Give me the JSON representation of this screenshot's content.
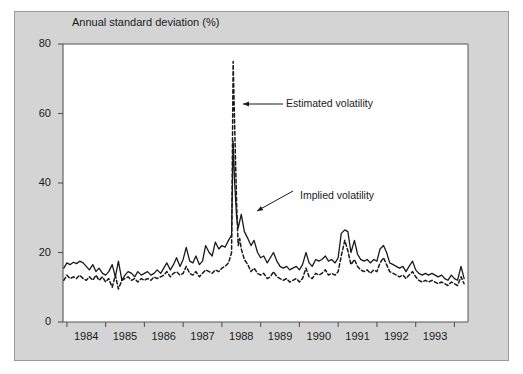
{
  "figure": {
    "background_color": "#d4d4d4",
    "plot_background_color": "#ffffff",
    "border_color": "#9a9a9a"
  },
  "chart_data": {
    "type": "line",
    "title": "Annual standard deviation (%)",
    "xlabel": "",
    "ylabel": "Annual standard deviation (%)",
    "xlim": [
      1983.4,
      1993.85
    ],
    "ylim": [
      0,
      80
    ],
    "yticks": [
      0,
      20,
      40,
      60,
      80
    ],
    "ytick_labels": [
      "0",
      "20",
      "40",
      "60",
      "80"
    ],
    "xticks": [
      1984,
      1985,
      1986,
      1987,
      1988,
      1989,
      1990,
      1991,
      1992,
      1993
    ],
    "xtick_labels": [
      "1984",
      "1985",
      "1986",
      "1987",
      "1988",
      "1989",
      "1990",
      "1991",
      "1992",
      "1993"
    ],
    "grid": false,
    "legend_position": "inline-annotations",
    "annotations": [
      {
        "text": "Estimated volatility",
        "series": "Estimated volatility",
        "arrow": "left",
        "text_x": 286,
        "text_y": 104,
        "arrow_from_x": 283,
        "arrow_from_y": 104,
        "arrow_to_x": 243,
        "arrow_to_y": 104
      },
      {
        "text": "Implied volatility",
        "series": "Implied volatility",
        "arrow": "down-left",
        "text_x": 300,
        "text_y": 196,
        "arrow_from_x": 293,
        "arrow_from_y": 191,
        "arrow_to_x": 257,
        "arrow_to_y": 211
      }
    ],
    "series": [
      {
        "name": "Implied volatility",
        "style": "solid",
        "color": "#1a1a1a",
        "x": [
          1983.42,
          1983.5,
          1983.58,
          1983.67,
          1983.75,
          1983.83,
          1983.92,
          1984.0,
          1984.08,
          1984.17,
          1984.25,
          1984.33,
          1984.42,
          1984.5,
          1984.58,
          1984.67,
          1984.75,
          1984.83,
          1984.92,
          1985.0,
          1985.08,
          1985.17,
          1985.25,
          1985.33,
          1985.42,
          1985.5,
          1985.58,
          1985.67,
          1985.75,
          1985.83,
          1985.92,
          1986.0,
          1986.08,
          1986.17,
          1986.25,
          1986.33,
          1986.42,
          1986.5,
          1986.58,
          1986.67,
          1986.75,
          1986.83,
          1986.92,
          1987.0,
          1987.08,
          1987.17,
          1987.25,
          1987.33,
          1987.42,
          1987.5,
          1987.58,
          1987.67,
          1987.75,
          1987.79,
          1987.83,
          1987.88,
          1987.92,
          1987.96,
          1988.0,
          1988.08,
          1988.17,
          1988.25,
          1988.33,
          1988.42,
          1988.5,
          1988.58,
          1988.67,
          1988.75,
          1988.83,
          1988.92,
          1989.0,
          1989.08,
          1989.17,
          1989.25,
          1989.33,
          1989.42,
          1989.5,
          1989.58,
          1989.67,
          1989.75,
          1989.83,
          1989.92,
          1990.0,
          1990.08,
          1990.17,
          1990.25,
          1990.33,
          1990.42,
          1990.5,
          1990.58,
          1990.67,
          1990.75,
          1990.83,
          1990.92,
          1991.0,
          1991.08,
          1991.17,
          1991.25,
          1991.33,
          1991.42,
          1991.5,
          1991.58,
          1991.67,
          1991.75,
          1991.83,
          1991.92,
          1992.0,
          1992.08,
          1992.17,
          1992.25,
          1992.33,
          1992.42,
          1992.5,
          1992.58,
          1992.67,
          1992.75,
          1992.83,
          1992.92,
          1993.0,
          1993.08,
          1993.17,
          1993.25,
          1993.33,
          1993.42,
          1993.5,
          1993.58,
          1993.67,
          1993.75
        ],
        "y": [
          15.5,
          17.0,
          16.5,
          17.2,
          16.8,
          17.5,
          17.0,
          16.0,
          15.0,
          16.5,
          14.5,
          15.5,
          14.0,
          13.5,
          14.5,
          16.5,
          13.0,
          17.5,
          12.0,
          13.5,
          14.5,
          14.0,
          13.0,
          14.5,
          13.5,
          14.0,
          14.5,
          13.5,
          14.0,
          15.0,
          14.0,
          15.5,
          17.0,
          15.0,
          16.5,
          18.5,
          16.0,
          18.0,
          21.5,
          17.5,
          17.0,
          19.0,
          16.5,
          17.5,
          22.0,
          20.0,
          19.0,
          23.0,
          21.0,
          22.0,
          21.5,
          23.5,
          25.0,
          52.0,
          40.0,
          30.0,
          27.0,
          29.0,
          31.0,
          26.0,
          24.0,
          22.0,
          23.5,
          20.0,
          18.5,
          19.0,
          17.0,
          18.5,
          20.0,
          17.5,
          16.0,
          15.5,
          16.0,
          15.0,
          15.5,
          16.0,
          15.0,
          16.5,
          20.0,
          17.0,
          16.0,
          18.0,
          17.5,
          18.0,
          19.0,
          17.5,
          18.0,
          17.0,
          18.5,
          25.5,
          26.5,
          26.0,
          20.0,
          23.5,
          19.5,
          18.0,
          17.5,
          18.0,
          17.0,
          18.0,
          17.5,
          21.0,
          22.0,
          20.0,
          17.0,
          16.5,
          16.0,
          15.5,
          16.0,
          14.5,
          16.0,
          17.5,
          15.0,
          14.0,
          13.5,
          14.0,
          13.5,
          14.0,
          13.5,
          13.0,
          13.5,
          12.5,
          12.0,
          13.5,
          12.5,
          12.0,
          16.0,
          12.5
        ]
      },
      {
        "name": "Estimated volatility",
        "style": "dashed",
        "color": "#1a1a1a",
        "x": [
          1983.42,
          1983.5,
          1983.58,
          1983.67,
          1983.75,
          1983.83,
          1983.92,
          1984.0,
          1984.08,
          1984.17,
          1984.25,
          1984.33,
          1984.42,
          1984.5,
          1984.58,
          1984.67,
          1984.75,
          1984.83,
          1984.92,
          1985.0,
          1985.08,
          1985.17,
          1985.25,
          1985.33,
          1985.42,
          1985.5,
          1985.58,
          1985.67,
          1985.75,
          1985.83,
          1985.92,
          1986.0,
          1986.08,
          1986.17,
          1986.25,
          1986.33,
          1986.42,
          1986.5,
          1986.58,
          1986.67,
          1986.75,
          1986.83,
          1986.92,
          1987.0,
          1987.08,
          1987.17,
          1987.25,
          1987.33,
          1987.42,
          1987.5,
          1987.58,
          1987.67,
          1987.75,
          1987.79,
          1987.83,
          1987.88,
          1987.92,
          1987.96,
          1988.0,
          1988.08,
          1988.17,
          1988.25,
          1988.33,
          1988.42,
          1988.5,
          1988.58,
          1988.67,
          1988.75,
          1988.83,
          1988.92,
          1989.0,
          1989.08,
          1989.17,
          1989.25,
          1989.33,
          1989.42,
          1989.5,
          1989.58,
          1989.67,
          1989.75,
          1989.83,
          1989.92,
          1990.0,
          1990.08,
          1990.17,
          1990.25,
          1990.33,
          1990.42,
          1990.5,
          1990.58,
          1990.67,
          1990.75,
          1990.83,
          1990.92,
          1991.0,
          1991.08,
          1991.17,
          1991.25,
          1991.33,
          1991.42,
          1991.5,
          1991.58,
          1991.67,
          1991.75,
          1991.83,
          1991.92,
          1992.0,
          1992.08,
          1992.17,
          1992.25,
          1992.33,
          1992.42,
          1992.5,
          1992.58,
          1992.67,
          1992.75,
          1992.83,
          1992.92,
          1993.0,
          1993.08,
          1993.17,
          1993.25,
          1993.33,
          1993.42,
          1993.5,
          1993.58,
          1993.67,
          1993.75
        ],
        "y": [
          12.0,
          13.5,
          12.5,
          13.0,
          12.5,
          13.5,
          12.5,
          12.0,
          13.0,
          12.0,
          13.5,
          12.0,
          13.0,
          11.5,
          12.5,
          10.0,
          13.5,
          9.5,
          12.0,
          12.5,
          13.0,
          12.0,
          12.5,
          11.5,
          12.5,
          12.0,
          12.5,
          12.0,
          13.0,
          12.5,
          13.0,
          13.5,
          14.5,
          13.0,
          14.0,
          14.5,
          13.5,
          14.0,
          16.0,
          14.0,
          13.5,
          14.5,
          13.0,
          14.0,
          15.0,
          14.5,
          14.0,
          15.0,
          14.5,
          15.5,
          16.0,
          17.0,
          20.0,
          75.0,
          56.0,
          34.0,
          22.0,
          24.0,
          21.0,
          18.0,
          16.5,
          14.5,
          15.5,
          14.0,
          13.5,
          14.0,
          12.5,
          13.0,
          14.5,
          13.0,
          12.5,
          12.0,
          12.5,
          11.5,
          12.0,
          12.5,
          11.5,
          12.5,
          15.5,
          13.0,
          12.5,
          14.0,
          13.5,
          14.0,
          15.0,
          13.5,
          14.0,
          13.5,
          14.5,
          19.0,
          23.5,
          20.5,
          16.5,
          18.0,
          16.0,
          15.0,
          14.5,
          15.0,
          14.0,
          15.0,
          14.5,
          17.0,
          18.5,
          16.5,
          14.5,
          14.0,
          13.5,
          13.0,
          13.5,
          12.5,
          13.5,
          14.5,
          13.0,
          12.0,
          11.5,
          12.0,
          11.5,
          12.0,
          11.5,
          11.0,
          11.5,
          11.0,
          10.5,
          11.5,
          11.0,
          10.5,
          13.0,
          11.0
        ]
      }
    ]
  }
}
